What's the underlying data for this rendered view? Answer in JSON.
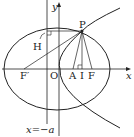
{
  "diagram": {
    "labels": {
      "y_axis": "y",
      "x_axis": "x",
      "P": "P",
      "H": "H",
      "F_prime": "F′",
      "O": "O",
      "A": "A",
      "I": "I",
      "F": "F",
      "directrix": "x=−a"
    },
    "colors": {
      "stroke": "#222222",
      "background": "#ffffff"
    }
  }
}
